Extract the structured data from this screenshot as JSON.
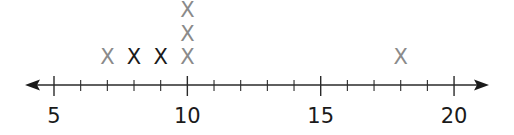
{
  "chart_data": {
    "type": "dot-plot",
    "title": "",
    "xlabel": "",
    "ylabel": "",
    "xlim": [
      4,
      21
    ],
    "major_ticks": [
      5,
      10,
      15,
      20
    ],
    "minor_tick_step": 1,
    "tick_labels": [
      "5",
      "10",
      "15",
      "20"
    ],
    "marker": "X",
    "grid": false,
    "legend": null,
    "points": [
      {
        "value": 7,
        "count": 1,
        "colors": [
          "#8a8a8a"
        ]
      },
      {
        "value": 8,
        "count": 1,
        "colors": [
          "#1a1a1a"
        ]
      },
      {
        "value": 9,
        "count": 1,
        "colors": [
          "#1a1a1a"
        ]
      },
      {
        "value": 10,
        "count": 3,
        "colors": [
          "#8a8a8a",
          "#8a8a8a",
          "#8a8a8a"
        ]
      },
      {
        "value": 18,
        "count": 1,
        "colors": [
          "#8a8a8a"
        ]
      }
    ],
    "colors": {
      "gray_mark": "#8a8a8a",
      "black_mark": "#1a1a1a",
      "axis": "#2a2a2a"
    }
  }
}
